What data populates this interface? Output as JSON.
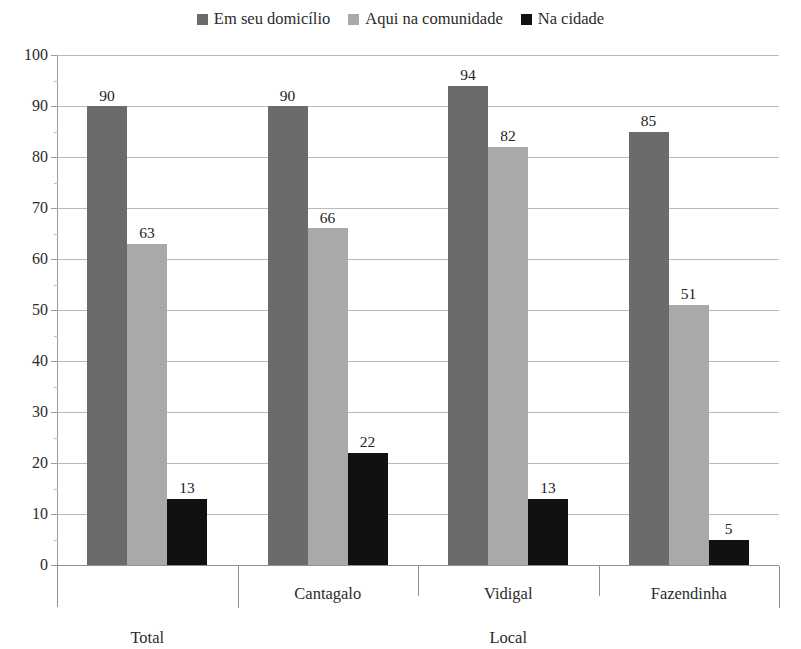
{
  "chart_data": {
    "type": "bar",
    "title": "",
    "xlabel": "",
    "ylabel": "",
    "ylim": [
      0,
      100
    ],
    "ytick_step": 10,
    "grid": true,
    "legend_position": "top-center",
    "categories": [
      "Total",
      "Cantagalo",
      "Vidigal",
      "Fazendinha"
    ],
    "series": [
      {
        "name": "Em seu domicílio",
        "color": "#6b6b6b",
        "values": [
          90,
          90,
          94,
          85
        ]
      },
      {
        "name": "Aqui na comunidade",
        "color": "#a9a9a9",
        "values": [
          63,
          66,
          82,
          51
        ]
      },
      {
        "name": "Na cidade",
        "color": "#111111",
        "values": [
          13,
          22,
          13,
          5
        ]
      }
    ],
    "yticks": [
      "100",
      "90",
      "80",
      "70",
      "60",
      "50",
      "40",
      "30",
      "20",
      "10",
      "0"
    ],
    "axis_groups": [
      {
        "label": "Total",
        "members": [
          "Total"
        ]
      },
      {
        "label": "Local",
        "members": [
          "Cantagalo",
          "Vidigal",
          "Fazendinha"
        ]
      }
    ]
  },
  "legend": {
    "entries": [
      {
        "label": "Em seu domicílio",
        "swatch": "legend-swatch-dark-gray"
      },
      {
        "label": "Aqui na comunidade",
        "swatch": "legend-swatch-light-gray"
      },
      {
        "label": "Na cidade",
        "swatch": "legend-swatch-black"
      }
    ]
  },
  "axis": {
    "tier1_labels": [
      "Cantagalo",
      "Vidigal",
      "Fazendinha"
    ],
    "tier2_labels": [
      "Total",
      "Local"
    ]
  }
}
